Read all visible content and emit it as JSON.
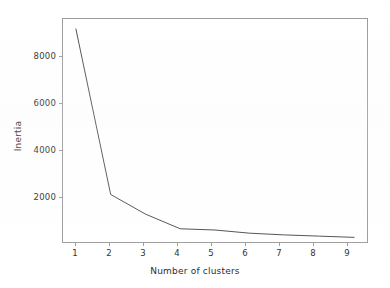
{
  "chart_data": {
    "type": "line",
    "title": "",
    "xlabel": "Number of clusters",
    "ylabel": "Inertia",
    "x": [
      1,
      2,
      3,
      4,
      5,
      6,
      7,
      8,
      9
    ],
    "values": [
      9150,
      2400,
      1600,
      1000,
      950,
      820,
      750,
      700,
      650
    ],
    "series": [
      {
        "name": "Inertia",
        "values": [
          9150,
          2400,
          1600,
          1000,
          950,
          820,
          750,
          700,
          650
        ]
      }
    ],
    "xtick_labels": [
      "1",
      "2",
      "3",
      "4",
      "5",
      "6",
      "7",
      "8",
      "9"
    ],
    "ytick_labels": [
      "2000",
      "4000",
      "6000",
      "8000"
    ],
    "ytick_values": [
      2000,
      4000,
      6000,
      8000
    ],
    "xlim": [
      0.6,
      9.4
    ],
    "ylim": [
      420,
      9600
    ],
    "grid": false,
    "legend": false,
    "legend_position": "none",
    "line_color": "#4d4d4d",
    "background_color": "#ffffff",
    "axis_color": "#9a9a9a"
  }
}
